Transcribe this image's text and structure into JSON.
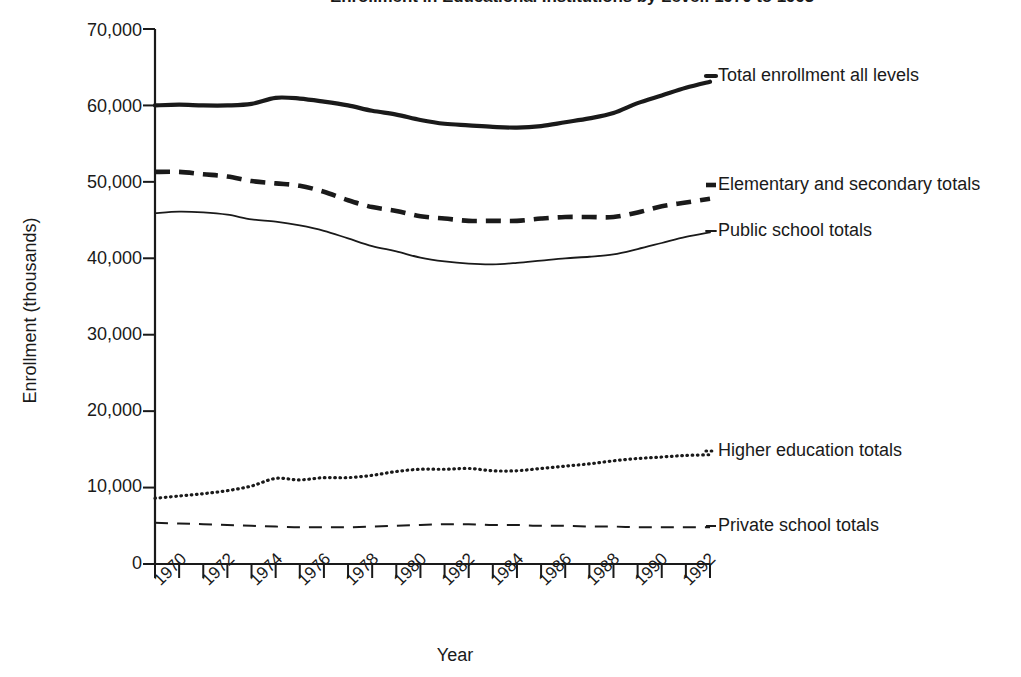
{
  "figure": {
    "bullet_icon": "bullet-marker",
    "title": "Enrollment in Educational Institutions by Level: 1970 to 1993",
    "title_visible_note": "clipped at top edge"
  },
  "axes": {
    "x_title": "Year",
    "y_title": "Enrollment (thousands)",
    "y_ticks": [
      "70,000",
      "60,000",
      "50,000",
      "40,000",
      "30,000",
      "20,000",
      "10,000",
      "0"
    ],
    "x_ticks": [
      "1970",
      "1972",
      "1974",
      "1976",
      "1978",
      "1980",
      "1982",
      "1984",
      "1986",
      "1988",
      "1990",
      "1992"
    ]
  },
  "series_labels": {
    "total": "Total enrollment all levels",
    "elemsec": "Elementary and secondary totals",
    "public": "Public school totals",
    "higher": "Higher education totals",
    "private": "Private school totals"
  },
  "colors": {
    "ink": "#1a1a1a",
    "background": "#ffffff"
  },
  "chart_data": {
    "type": "line",
    "title": "Enrollment in Educational Institutions by Level: 1970 to 1993",
    "xlabel": "Year",
    "ylabel": "Enrollment (thousands)",
    "xlim": [
      1970,
      1993
    ],
    "ylim": [
      0,
      70000
    ],
    "y_tick_values": [
      0,
      10000,
      20000,
      30000,
      40000,
      50000,
      60000,
      70000
    ],
    "x_tick_values": [
      1970,
      1972,
      1974,
      1976,
      1978,
      1980,
      1982,
      1984,
      1986,
      1988,
      1990,
      1992
    ],
    "grid": false,
    "legend": "inline-right-of-line-ends",
    "x": [
      1970,
      1971,
      1972,
      1973,
      1974,
      1975,
      1976,
      1977,
      1978,
      1979,
      1980,
      1981,
      1982,
      1983,
      1984,
      1985,
      1986,
      1987,
      1988,
      1989,
      1990,
      1991,
      1992,
      1993
    ],
    "series": [
      {
        "name": "Total enrollment all levels",
        "style": "solid-thick",
        "values": [
          60000,
          60100,
          60000,
          60000,
          60200,
          61000,
          60900,
          60500,
          60000,
          59300,
          58800,
          58100,
          57600,
          57400,
          57200,
          57100,
          57300,
          57800,
          58300,
          59000,
          60300,
          61300,
          62300,
          63100
        ]
      },
      {
        "name": "Elementary and secondary totals",
        "style": "dashed-thick",
        "values": [
          51300,
          51300,
          51000,
          50700,
          50100,
          49800,
          49500,
          48700,
          47600,
          46700,
          46200,
          45500,
          45200,
          44900,
          44900,
          44900,
          45200,
          45400,
          45400,
          45400,
          46000,
          46800,
          47300,
          47800
        ]
      },
      {
        "name": "Public school totals",
        "style": "solid-thin",
        "values": [
          45900,
          46100,
          46000,
          45700,
          45100,
          44800,
          44300,
          43600,
          42600,
          41600,
          40900,
          40100,
          39600,
          39300,
          39200,
          39400,
          39700,
          40000,
          40200,
          40500,
          41200,
          42000,
          42800,
          43400
        ]
      },
      {
        "name": "Higher education totals",
        "style": "dotted",
        "values": [
          8600,
          8900,
          9200,
          9600,
          10200,
          11200,
          11000,
          11300,
          11300,
          11600,
          12100,
          12400,
          12400,
          12500,
          12200,
          12200,
          12500,
          12800,
          13100,
          13500,
          13800,
          14000,
          14200,
          14300
        ]
      },
      {
        "name": "Private school totals",
        "style": "dashed-thin",
        "values": [
          5400,
          5300,
          5200,
          5100,
          5000,
          4900,
          4800,
          4800,
          4800,
          4900,
          5000,
          5100,
          5200,
          5200,
          5100,
          5100,
          5000,
          5000,
          4900,
          4900,
          4800,
          4800,
          4800,
          4800
        ]
      }
    ]
  }
}
